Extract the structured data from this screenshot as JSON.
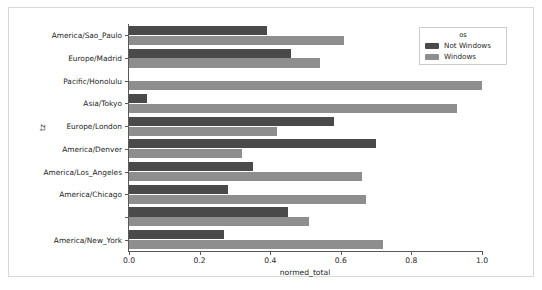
{
  "chart_data": {
    "type": "bar",
    "orientation": "horizontal",
    "title": "",
    "xlabel": "normed_total",
    "ylabel": "tz",
    "xlim": [
      0.0,
      1.0
    ],
    "xticks": [
      "0.0",
      "0.2",
      "0.4",
      "0.6",
      "0.8",
      "1.0"
    ],
    "xtick_values": [
      0.0,
      0.2,
      0.4,
      0.6,
      0.8,
      1.0
    ],
    "grid": false,
    "legend": {
      "title": "os",
      "position": "upper right",
      "entries": [
        {
          "label": "Not Windows",
          "color": "#4a4a4a"
        },
        {
          "label": "Windows",
          "color": "#8e8e8e"
        }
      ]
    },
    "categories": [
      "America/Sao_Paulo",
      "Europe/Madrid",
      "Pacific/Honolulu",
      "Asia/Tokyo",
      "Europe/London",
      "America/Denver",
      "America/Los_Angeles",
      "America/Chicago",
      "",
      "America/New_York"
    ],
    "series": [
      {
        "name": "Not Windows",
        "color": "#4a4a4a",
        "values": [
          0.39,
          0.46,
          0.0,
          0.05,
          0.58,
          0.7,
          0.35,
          0.28,
          0.45,
          0.27
        ]
      },
      {
        "name": "Windows",
        "color": "#8e8e8e",
        "values": [
          0.61,
          0.54,
          1.0,
          0.93,
          0.42,
          0.32,
          0.66,
          0.67,
          0.51,
          0.72
        ]
      }
    ]
  },
  "colors": {
    "not_windows": "#4a4a4a",
    "windows": "#8e8e8e",
    "axis": "#5a5a5a",
    "frame": "#d9d9d9",
    "background": "#ffffff",
    "text": "#262626"
  }
}
